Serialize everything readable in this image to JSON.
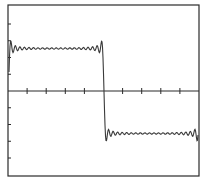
{
  "chart_data": {
    "type": "line",
    "title": "",
    "xlabel": "",
    "ylabel": "",
    "grid": false,
    "legend": null,
    "xlim": [
      -1,
      1
    ],
    "ylim": [
      -1.6,
      1.6
    ],
    "x_ticks": [
      -0.8,
      -0.6,
      -0.4,
      -0.2,
      0,
      0.2,
      0.4,
      0.6,
      0.8
    ],
    "y_ticks": [
      -1.25,
      -1.0,
      -0.75,
      -0.5,
      -0.25,
      0.25,
      0.5,
      0.75,
      1.0,
      1.25
    ],
    "series": [
      {
        "name": "partial Fourier sum",
        "high_level": 1.0,
        "low_level": -1.0,
        "discontinuity_x": 0,
        "overshoot_peak": 1.18,
        "undershoot_trough": -1.18,
        "harmonics": 21
      }
    ],
    "colors": {
      "line": "#3a3a3a",
      "axes": "#2a2a2a",
      "background": "#ffffff"
    }
  }
}
